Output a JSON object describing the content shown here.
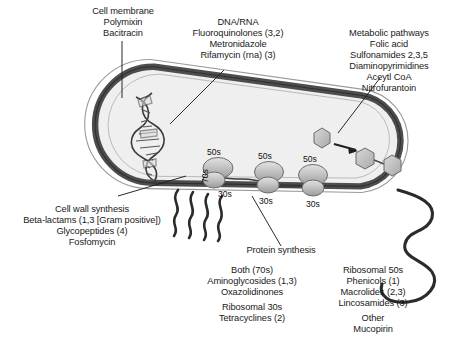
{
  "figure": {
    "colors": {
      "membrane": "#4a4a4a",
      "cytoplasm": "#efefef",
      "outline": "#808080",
      "text": "#1a1a1a",
      "leader": "#222222",
      "organelle": "#b8b8b8"
    }
  },
  "labels": {
    "cell_membrane": {
      "lines": [
        "Cell membrane",
        "Polymixin",
        "Bacitracin"
      ]
    },
    "dna_rna": {
      "lines": [
        "DNA/RNA",
        "Fluoroquinolones (3,2)",
        "Metronidazole",
        "Rifamycin (rna) (3)"
      ]
    },
    "metabolic": {
      "lines": [
        "Metabolic pathways",
        "Folic acid",
        "Sulfonamides 2,3,5",
        "Diaminopyrimidines",
        "Aceytl CoA",
        "Nitrofurantoin"
      ]
    },
    "cell_wall": {
      "lines": [
        "Cell wall synthesis",
        "Beta-lactams (1,3 [Gram positive])",
        "Glycopeptides (4)",
        "Fosfomycin"
      ]
    },
    "protein_synthesis": {
      "lines": [
        "Protein synthesis"
      ]
    },
    "ribosome_both": {
      "group_a": [
        "Both (70s)",
        "Aminoglycosides (1,3)",
        "Oxazolidinones"
      ],
      "group_b": [
        "Ribosomal 30s",
        "Tetracyclines (2)"
      ]
    },
    "ribosome_50s": {
      "group_a": [
        "Ribosomal 50s",
        "Phenicols (1)",
        "Macrolides (2,3)",
        "Lincosamides (3)"
      ],
      "group_b": [
        "Other",
        "Mucopirin"
      ]
    }
  },
  "ribosomes": [
    {
      "large": "50s",
      "small": "30s",
      "whole": "70s"
    },
    {
      "large": "50s",
      "small": "30s"
    },
    {
      "large": "50s",
      "small": "30s"
    }
  ]
}
